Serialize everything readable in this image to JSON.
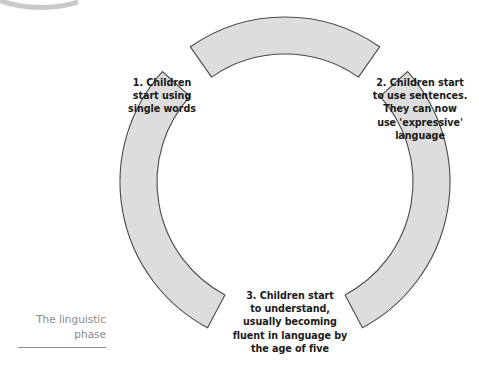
{
  "diagram": {
    "title_caption": "The linguistic\nphase",
    "caption_line1": "The linguistic",
    "caption_line2": "phase",
    "type": "cycle-ring",
    "segment_count": 3,
    "colors": {
      "segment_fill": "#dddddd",
      "segment_stroke": "#4a4a4a",
      "label_text": "#1a1a1a",
      "caption_text": "#8a8a8a",
      "background": "#ffffff",
      "artifact_arc": "#c9c9c9"
    },
    "geometry": {
      "center_x": 285,
      "center_y": 182,
      "outer_radius": 165,
      "inner_radius": 128,
      "segments": [
        {
          "name": "top-segment",
          "start_angle_deg": -125,
          "end_angle_deg": -55
        },
        {
          "name": "right-segment",
          "start_angle_deg": -42,
          "end_angle_deg": 62
        },
        {
          "name": "left-segment",
          "start_angle_deg": 118,
          "end_angle_deg": 222
        }
      ]
    },
    "labels": [
      {
        "id": "label-1",
        "number": "1.",
        "lines": [
          "1. Children",
          "start using",
          "single words"
        ],
        "text": "1. Children start using single words"
      },
      {
        "id": "label-2",
        "number": "2.",
        "lines": [
          "2. Children start",
          "to use sentences.",
          "They can now",
          "use 'expressive'",
          "language"
        ],
        "text": "2. Children start to use sentences. They can now use 'expressive' language"
      },
      {
        "id": "label-3",
        "number": "3.",
        "lines": [
          "3. Children start",
          "to understand,",
          "usually becoming",
          "fluent in language by",
          "the age of five"
        ],
        "text": "3. Children start to understand, usually becoming fluent in language by the age of five"
      }
    ]
  }
}
